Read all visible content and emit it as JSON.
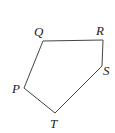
{
  "diagram": {
    "type": "pentagon",
    "colors": {
      "stroke": "#444444",
      "label": "#222222",
      "background": "#ffffff"
    },
    "vertices": [
      {
        "id": "Q",
        "label": "Q",
        "x": 43,
        "y": 41,
        "label_x": 34,
        "label_y": 36
      },
      {
        "id": "R",
        "label": "R",
        "x": 103,
        "y": 40,
        "label_x": 96,
        "label_y": 35
      },
      {
        "id": "S",
        "label": "S",
        "x": 102,
        "y": 66,
        "label_x": 103,
        "label_y": 75
      },
      {
        "id": "T",
        "label": "T",
        "x": 55,
        "y": 113,
        "label_x": 50,
        "label_y": 128
      },
      {
        "id": "P",
        "label": "P",
        "x": 24,
        "y": 88,
        "label_x": 12,
        "label_y": 93
      }
    ],
    "edges": [
      [
        "Q",
        "R"
      ],
      [
        "R",
        "S"
      ],
      [
        "S",
        "T"
      ],
      [
        "T",
        "P"
      ],
      [
        "P",
        "Q"
      ]
    ]
  }
}
